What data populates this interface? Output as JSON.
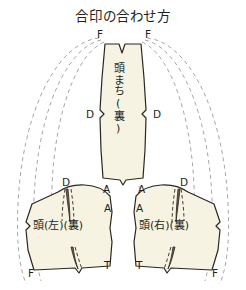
{
  "title": "合印の合わせ方",
  "colors": {
    "background": "#ffffff",
    "piece_fill": "#f6f3e2",
    "piece_stroke": "#2b2621",
    "guide_dash": "#9a9a9a",
    "dart_fill": "#6b6255",
    "text": "#231f1c"
  },
  "pieces": [
    {
      "id": "center",
      "label": "頭まち(裏)",
      "orientation": "vertical",
      "marks": [
        "F",
        "F",
        "D",
        "D",
        "A",
        "A"
      ]
    },
    {
      "id": "left",
      "label": "頭(左)(裏)",
      "orientation": "horizontal",
      "marks": [
        "D",
        "A",
        "T",
        "F"
      ]
    },
    {
      "id": "right",
      "label": "頭(右)(裏)",
      "orientation": "horizontal",
      "marks": [
        "D",
        "A",
        "T",
        "F"
      ]
    }
  ],
  "marks": {
    "center_top_left_F": "F",
    "center_top_right_F": "F",
    "center_mid_left_D": "D",
    "center_mid_right_D": "D",
    "center_bottom_left_A": "A",
    "center_bottom_right_A": "A",
    "left_top_D": "D",
    "left_right_A": "A",
    "left_right_T": "T",
    "left_bottom_F": "F",
    "right_top_D": "D",
    "right_left_A": "A",
    "right_left_T": "T",
    "right_bottom_F": "F"
  },
  "labels": {
    "center_piece": "頭まち(裏)",
    "left_piece": "頭(左)(裏)",
    "right_piece": "頭(右)(裏)"
  }
}
